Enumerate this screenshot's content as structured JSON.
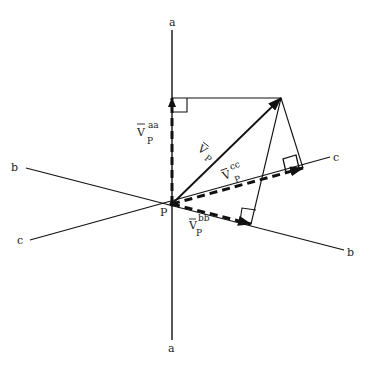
{
  "diagram": {
    "type": "vector-projection",
    "colors": {
      "ink": "#111111",
      "background": "#ffffff"
    },
    "point": {
      "label": "P",
      "x": 172,
      "y": 204
    },
    "axes": [
      {
        "name": "a",
        "label_start": "a",
        "label_end": "a"
      },
      {
        "name": "b",
        "label_start": "b",
        "label_end": "b"
      },
      {
        "name": "c",
        "label_start": "c",
        "label_end": "c"
      }
    ],
    "vectors": {
      "main": {
        "base": "V",
        "sub": "P",
        "note": "V̄ P"
      },
      "proj_aa": {
        "base": "V",
        "sup": "aa",
        "sub": "P"
      },
      "proj_bb": {
        "base": "V",
        "sup": "bb",
        "sub": "P"
      },
      "proj_cc": {
        "base": "V",
        "sup": "cc",
        "sub": "P"
      }
    }
  }
}
